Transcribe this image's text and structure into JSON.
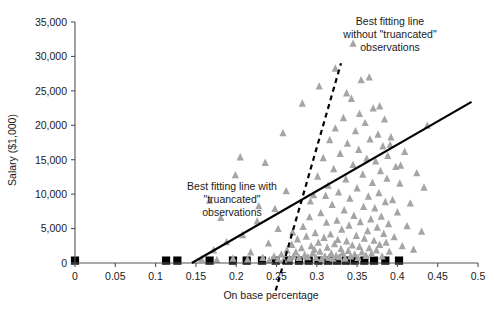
{
  "chart_data": {
    "type": "scatter",
    "title": "",
    "xlabel": "On base percentage",
    "ylabel": "Salary ($1,000)",
    "xlim": [
      0,
      0.5
    ],
    "ylim": [
      0,
      35000
    ],
    "grid": false,
    "legend_position": "none",
    "xticks": [
      "0",
      "0.05",
      "0.1",
      "0.15",
      "0.2",
      "0.25",
      "0.3",
      "0.35",
      "0.4",
      "0.45",
      "0.5"
    ],
    "xtick_values": [
      0,
      0.05,
      0.1,
      0.15,
      0.2,
      0.25,
      0.3,
      0.35,
      0.4,
      0.45,
      0.5
    ],
    "yticks": [
      "0",
      "5,000",
      "10,000",
      "15,000",
      "20,000",
      "25,000",
      "30,000",
      "35,000"
    ],
    "ytick_values": [
      0,
      5000,
      10000,
      15000,
      20000,
      25000,
      30000,
      35000
    ],
    "series": [
      {
        "name": "Players (non-truncated salaries)",
        "marker": "triangle",
        "color": "#a5a5a5",
        "points": [
          [
            0.157,
            500
          ],
          [
            0.176,
            400
          ],
          [
            0.196,
            600
          ],
          [
            0.214,
            450
          ],
          [
            0.233,
            700
          ],
          [
            0.241,
            350
          ],
          [
            0.247,
            900
          ],
          [
            0.252,
            500
          ],
          [
            0.256,
            1200
          ],
          [
            0.259,
            400
          ],
          [
            0.263,
            1800
          ],
          [
            0.266,
            600
          ],
          [
            0.269,
            2600
          ],
          [
            0.271,
            900
          ],
          [
            0.274,
            1500
          ],
          [
            0.276,
            3400
          ],
          [
            0.278,
            700
          ],
          [
            0.281,
            2100
          ],
          [
            0.283,
            5200
          ],
          [
            0.285,
            1100
          ],
          [
            0.287,
            3800
          ],
          [
            0.289,
            800
          ],
          [
            0.291,
            6600
          ],
          [
            0.293,
            2400
          ],
          [
            0.295,
            1400
          ],
          [
            0.296,
            9800
          ],
          [
            0.298,
            4300
          ],
          [
            0.299,
            700
          ],
          [
            0.301,
            12500
          ],
          [
            0.302,
            2900
          ],
          [
            0.304,
            1600
          ],
          [
            0.305,
            7200
          ],
          [
            0.306,
            500
          ],
          [
            0.308,
            15200
          ],
          [
            0.309,
            3600
          ],
          [
            0.31,
            900
          ],
          [
            0.312,
            5800
          ],
          [
            0.313,
            2200
          ],
          [
            0.314,
            11200
          ],
          [
            0.315,
            700
          ],
          [
            0.316,
            17800
          ],
          [
            0.317,
            4100
          ],
          [
            0.318,
            1300
          ],
          [
            0.319,
            8400
          ],
          [
            0.32,
            600
          ],
          [
            0.321,
            13600
          ],
          [
            0.322,
            2700
          ],
          [
            0.323,
            19500
          ],
          [
            0.324,
            1000
          ],
          [
            0.325,
            6100
          ],
          [
            0.326,
            3300
          ],
          [
            0.327,
            10200
          ],
          [
            0.328,
            800
          ],
          [
            0.329,
            15800
          ],
          [
            0.33,
            2000
          ],
          [
            0.331,
            4800
          ],
          [
            0.332,
            1400
          ],
          [
            0.333,
            21000
          ],
          [
            0.334,
            7600
          ],
          [
            0.335,
            600
          ],
          [
            0.336,
            12100
          ],
          [
            0.337,
            3100
          ],
          [
            0.338,
            17300
          ],
          [
            0.339,
            1700
          ],
          [
            0.34,
            5400
          ],
          [
            0.341,
            9300
          ],
          [
            0.342,
            900
          ],
          [
            0.343,
            23800
          ],
          [
            0.344,
            2500
          ],
          [
            0.345,
            14200
          ],
          [
            0.346,
            6800
          ],
          [
            0.347,
            1200
          ],
          [
            0.348,
            19100
          ],
          [
            0.349,
            3900
          ],
          [
            0.35,
            10800
          ],
          [
            0.351,
            700
          ],
          [
            0.352,
            16400
          ],
          [
            0.353,
            2300
          ],
          [
            0.354,
            5900
          ],
          [
            0.355,
            26500
          ],
          [
            0.356,
            1500
          ],
          [
            0.357,
            12800
          ],
          [
            0.358,
            8100
          ],
          [
            0.359,
            3500
          ],
          [
            0.36,
            20300
          ],
          [
            0.361,
            1000
          ],
          [
            0.362,
            15100
          ],
          [
            0.363,
            4600
          ],
          [
            0.364,
            9600
          ],
          [
            0.365,
            2100
          ],
          [
            0.366,
            17900
          ],
          [
            0.367,
            6300
          ],
          [
            0.368,
            1300
          ],
          [
            0.369,
            11600
          ],
          [
            0.37,
            22400
          ],
          [
            0.371,
            3200
          ],
          [
            0.372,
            7900
          ],
          [
            0.373,
            14700
          ],
          [
            0.374,
            1800
          ],
          [
            0.375,
            5100
          ],
          [
            0.376,
            18600
          ],
          [
            0.377,
            10100
          ],
          [
            0.378,
            2600
          ],
          [
            0.379,
            13300
          ],
          [
            0.38,
            6700
          ],
          [
            0.381,
            900
          ],
          [
            0.382,
            16900
          ],
          [
            0.383,
            4200
          ],
          [
            0.384,
            20800
          ],
          [
            0.385,
            8800
          ],
          [
            0.386,
            2900
          ],
          [
            0.387,
            12200
          ],
          [
            0.388,
            15500
          ],
          [
            0.389,
            5600
          ],
          [
            0.39,
            1600
          ],
          [
            0.392,
            18200
          ],
          [
            0.394,
            9100
          ],
          [
            0.396,
            3700
          ],
          [
            0.398,
            13900
          ],
          [
            0.4,
            7300
          ],
          [
            0.403,
            11500
          ],
          [
            0.406,
            2400
          ],
          [
            0.409,
            16100
          ],
          [
            0.412,
            5300
          ],
          [
            0.416,
            8600
          ],
          [
            0.42,
            1900
          ],
          [
            0.424,
            13000
          ],
          [
            0.43,
            4500
          ],
          [
            0.437,
            19900
          ],
          [
            0.262,
            10400
          ],
          [
            0.252,
            4900
          ],
          [
            0.24,
            2800
          ],
          [
            0.228,
            8200
          ],
          [
            0.218,
            1500
          ],
          [
            0.208,
            4000
          ],
          [
            0.199,
            12700
          ],
          [
            0.188,
            3000
          ],
          [
            0.181,
            6500
          ],
          [
            0.172,
            1800
          ],
          [
            0.167,
            9000
          ],
          [
            0.205,
            15300
          ],
          [
            0.226,
            6000
          ],
          [
            0.236,
            14500
          ],
          [
            0.248,
            7800
          ],
          [
            0.258,
            18800
          ],
          [
            0.27,
            4400
          ],
          [
            0.282,
            23100
          ],
          [
            0.292,
            8900
          ],
          [
            0.303,
            25600
          ],
          [
            0.297,
            1900
          ],
          [
            0.311,
            9700
          ],
          [
            0.323,
            28200
          ],
          [
            0.337,
            24600
          ],
          [
            0.345,
            31800
          ],
          [
            0.353,
            21600
          ],
          [
            0.365,
            26900
          ],
          [
            0.378,
            22700
          ],
          [
            0.391,
            17100
          ],
          [
            0.404,
            14100
          ],
          [
            0.433,
            10900
          ]
        ]
      },
      {
        "name": "Players with truncated (minimum) salaries",
        "marker": "square",
        "color": "#000000",
        "points": [
          [
            0.0,
            350
          ],
          [
            0.113,
            350
          ],
          [
            0.127,
            350
          ],
          [
            0.167,
            350
          ],
          [
            0.196,
            350
          ],
          [
            0.213,
            350
          ],
          [
            0.232,
            350
          ],
          [
            0.249,
            350
          ],
          [
            0.265,
            350
          ],
          [
            0.278,
            350
          ],
          [
            0.29,
            350
          ],
          [
            0.302,
            350
          ],
          [
            0.314,
            350
          ],
          [
            0.325,
            350
          ],
          [
            0.336,
            350
          ],
          [
            0.347,
            350
          ],
          [
            0.359,
            350
          ],
          [
            0.371,
            350
          ],
          [
            0.385,
            350
          ],
          [
            0.402,
            350
          ]
        ]
      }
    ],
    "fit_lines": [
      {
        "name": "Best fitting line with truncated observations",
        "style": "solid",
        "color": "#000000",
        "x_start": 0.145,
        "y_start": 0,
        "x_end": 0.492,
        "y_end": 23400
      },
      {
        "name": "Best fitting line without truncated observations",
        "style": "dashed",
        "color": "#000000",
        "x_start": 0.249,
        "y_start": -4000,
        "x_end": 0.33,
        "y_end": 29000
      }
    ],
    "annotations": [
      {
        "name": "annotation-with-truncated",
        "lines": [
          "Best fitting line with",
          "\"truancated\"",
          "observations"
        ],
        "line1": "Best fitting line with",
        "line2": "\"truancated\"",
        "line3": "observations"
      },
      {
        "name": "annotation-without-truncated",
        "lines": [
          "Best fitting line",
          "without \"truancated\"",
          "observations"
        ],
        "line1": "Best fitting line",
        "line2": "without \"truancated\"",
        "line3": "observations"
      }
    ]
  }
}
